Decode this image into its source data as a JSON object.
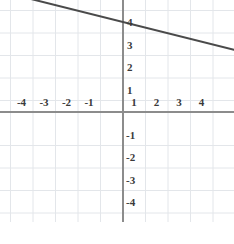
{
  "chart_data": {
    "type": "line",
    "title": "",
    "xlabel": "",
    "ylabel": "",
    "xlim": [
      -4.9,
      5.3
    ],
    "ylim": [
      -5.3,
      4.9
    ],
    "grid": true,
    "legend": null,
    "x_ticks": [
      -4,
      -3,
      -2,
      -1,
      1,
      2,
      3,
      4
    ],
    "y_ticks": [
      4,
      3,
      2,
      1,
      -1,
      -2,
      -3,
      -4
    ],
    "x_tick_labels": [
      "-4",
      "-3",
      "-2",
      "-1",
      "1",
      "2",
      "3",
      "4"
    ],
    "y_tick_labels": [
      "4",
      "3",
      "2",
      "1",
      "-1",
      "-2",
      "-3",
      "-4"
    ],
    "series": [
      {
        "name": "line",
        "equation": "y = -0.25x + 4",
        "slope": -0.25,
        "intercept": 4,
        "x": [
          -4.4,
          5.3
        ],
        "y": [
          5.1,
          2.68
        ],
        "color": "#4a4a4a",
        "width": 2
      }
    ]
  },
  "axes": {
    "x_axis_label": "x-axis",
    "y_axis_label": "y-axis",
    "axis_color": "#8c8c8c",
    "grid_color": "#e3e6ea",
    "background": "#ffffff",
    "tick_text_color": "#3a3a3a"
  },
  "x_ticks": [
    {
      "value": "-4",
      "px": 21.5
    },
    {
      "value": "-3",
      "px": 44.0
    },
    {
      "value": "-2",
      "px": 66.5
    },
    {
      "value": "-1",
      "px": 89.0
    },
    {
      "value": "1",
      "px": 134.0
    },
    {
      "value": "2",
      "px": 156.5
    },
    {
      "value": "3",
      "px": 179.0
    },
    {
      "value": "4",
      "px": 201.5
    }
  ],
  "y_ticks": [
    {
      "value": "4",
      "py": 22.0
    },
    {
      "value": "3",
      "py": 44.5
    },
    {
      "value": "2",
      "py": 67.0
    },
    {
      "value": "1",
      "py": 89.5
    },
    {
      "value": "-1",
      "py": 134.5
    },
    {
      "value": "-2",
      "py": 157.0
    },
    {
      "value": "-3",
      "py": 179.5
    },
    {
      "value": "-4",
      "py": 202.0
    }
  ]
}
